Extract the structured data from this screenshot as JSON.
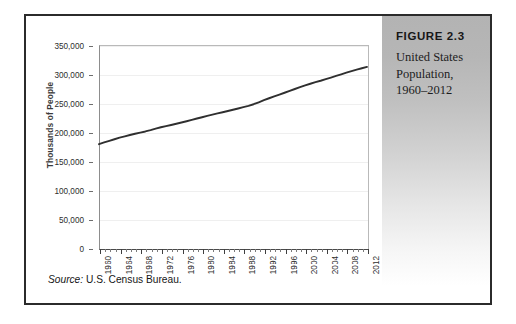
{
  "figure": {
    "number_label": "FIGURE 2.3",
    "caption_lines": [
      "United States",
      "Population,",
      "1960–2012"
    ],
    "source_label": "Source:",
    "source_text": "U.S. Census Bureau."
  },
  "colors": {
    "border": "#2b2b2b",
    "line": "#2f2f2f",
    "gridline": "#efefef",
    "panel_top": "#b3b3b3",
    "panel_bottom": "#ffffff",
    "text": "#1d1d1d"
  },
  "chart_data": {
    "type": "line",
    "title": "",
    "xlabel": "",
    "ylabel": "Thousands of People",
    "grid": true,
    "legend": "none",
    "xlim": [
      1960,
      2012
    ],
    "ylim": [
      0,
      350000
    ],
    "ytick_labels": [
      "350,000",
      "300,000",
      "250,000",
      "200,000",
      "150,000",
      "100,000",
      "50,000",
      "0"
    ],
    "ytick_values": [
      350000,
      300000,
      250000,
      200000,
      150000,
      100000,
      50000,
      0
    ],
    "xtick_labels": [
      "1960",
      "1964",
      "1968",
      "1972",
      "1976",
      "1980",
      "1984",
      "1988",
      "1992",
      "1996",
      "2000",
      "2004",
      "2008",
      "2012"
    ],
    "xtick_values": [
      1960,
      1964,
      1968,
      1972,
      1976,
      1980,
      1984,
      1988,
      1992,
      1996,
      2000,
      2004,
      2008,
      2012
    ],
    "xtick_minor_step": 1,
    "series": [
      {
        "name": "United States Population",
        "x": [
          1960,
          1961,
          1962,
          1963,
          1964,
          1965,
          1966,
          1967,
          1968,
          1969,
          1970,
          1971,
          1972,
          1973,
          1974,
          1975,
          1976,
          1977,
          1978,
          1979,
          1980,
          1981,
          1982,
          1983,
          1984,
          1985,
          1986,
          1987,
          1988,
          1989,
          1990,
          1991,
          1992,
          1993,
          1994,
          1995,
          1996,
          1997,
          1998,
          1999,
          2000,
          2001,
          2002,
          2003,
          2004,
          2005,
          2006,
          2007,
          2008,
          2009,
          2010,
          2011,
          2012
        ],
        "values": [
          180671,
          183691,
          186538,
          189242,
          191889,
          194303,
          196560,
          198712,
          200706,
          202677,
          205052,
          207661,
          209896,
          211909,
          213854,
          215973,
          218035,
          220239,
          222585,
          225055,
          227225,
          229466,
          231664,
          233792,
          235825,
          237924,
          240133,
          242289,
          244499,
          246819,
          249623,
          252981,
          256514,
          259919,
          263126,
          266278,
          269394,
          272647,
          275854,
          279040,
          282162,
          284969,
          287625,
          290108,
          292805,
          295517,
          298380,
          301231,
          304094,
          306772,
          309330,
          311588,
          313914
        ]
      }
    ]
  }
}
